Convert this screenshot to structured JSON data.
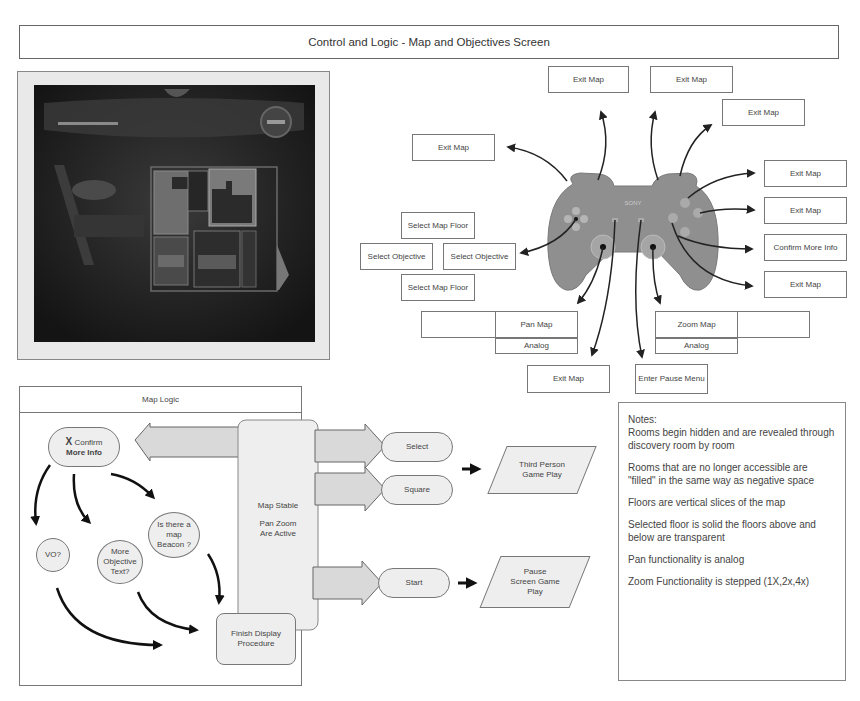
{
  "page": {
    "title": "Control and Logic - Map and Objectives Screen"
  },
  "game_screenshot": {
    "description": "In-game map screen showing floor plan overlay"
  },
  "controller": {
    "brand_label": "SONY",
    "mappings": {
      "l2": "Exit Map",
      "l1": "Exit Map",
      "r1": "Exit Map",
      "r2": "Exit Map",
      "triangle": "Exit Map",
      "circle": "Exit Map",
      "cross": "Confirm More Info",
      "square": "Exit Map",
      "dpad_up": "Select Map Floor",
      "dpad_left": "Select Objective",
      "dpad_right": "Select Objective",
      "dpad_down": "Select Map Floor",
      "left_stick": "Pan Map",
      "left_stick_type": "Analog",
      "right_stick": "Zoom Map",
      "right_stick_type": "Analog",
      "select": "Exit Map",
      "start": "Enter Pause Menu"
    }
  },
  "map_logic": {
    "title": "Map Logic",
    "confirm_node": {
      "icon": "X",
      "line1": "Confirm",
      "line2": "More Info"
    },
    "central_state": {
      "line1": "Map Stable",
      "line2": "Pan Zoom",
      "line3": "Are Active"
    },
    "decisions": [
      {
        "label": "VO?"
      },
      {
        "label": "More Objective Text?"
      },
      {
        "label": "Is there a map Beacon ?"
      }
    ],
    "finish_node": "Finish Display Procedure",
    "exits": [
      {
        "button": "Select",
        "result": "Third Person Game Play"
      },
      {
        "button": "Square",
        "result": "Third Person Game Play"
      },
      {
        "button": "Start",
        "result": "Pause Screen Game Play"
      }
    ],
    "results": {
      "third_person": "Third Person Game Play",
      "pause": "Pause Screen Game Play"
    }
  },
  "notes": {
    "heading": "Notes:",
    "items": [
      "Rooms begin hidden and are revealed through discovery room by room",
      "Rooms that are no longer accessible are \"filled\" in the same way as negative space",
      "Floors are vertical slices of the map",
      "Selected floor is solid the floors above and below are transparent",
      "Pan functionality is analog",
      "Zoom Functionality is stepped (1X,2x,4x)"
    ]
  }
}
